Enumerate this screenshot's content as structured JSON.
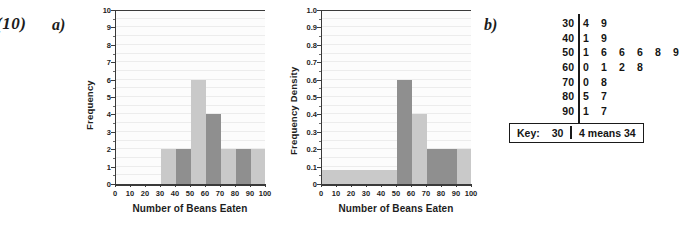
{
  "question": {
    "number": "(10)",
    "part_a": "a)",
    "part_b": "b)"
  },
  "chart_data": [
    {
      "id": "frequency-histogram",
      "type": "bar",
      "title": "",
      "xlabel": "Number of Beans Eaten",
      "ylabel": "Frequency",
      "xlim": [
        0,
        100
      ],
      "ylim": [
        0,
        10
      ],
      "xticks": [
        0,
        10,
        20,
        30,
        40,
        50,
        60,
        70,
        80,
        90,
        100
      ],
      "yticks": [
        0,
        1,
        2,
        3,
        4,
        5,
        6,
        7,
        8,
        9,
        10
      ],
      "grid": true,
      "bars": [
        {
          "x0": 30,
          "x1": 40,
          "value": 2,
          "color": "#c9c9c9"
        },
        {
          "x0": 40,
          "x1": 50,
          "value": 2,
          "color": "#8f8f8f"
        },
        {
          "x0": 50,
          "x1": 60,
          "value": 6,
          "color": "#c9c9c9"
        },
        {
          "x0": 60,
          "x1": 70,
          "value": 4,
          "color": "#8f8f8f"
        },
        {
          "x0": 70,
          "x1": 80,
          "value": 2,
          "color": "#c9c9c9"
        },
        {
          "x0": 80,
          "x1": 90,
          "value": 2,
          "color": "#8f8f8f"
        },
        {
          "x0": 90,
          "x1": 100,
          "value": 2,
          "color": "#c9c9c9"
        }
      ]
    },
    {
      "id": "frequency-density-histogram",
      "type": "bar",
      "title": "",
      "xlabel": "Number of Beans Eaten",
      "ylabel": "Frequency  Density",
      "xlim": [
        0,
        100
      ],
      "ylim": [
        0,
        1.0
      ],
      "xticks": [
        0,
        10,
        20,
        30,
        40,
        50,
        60,
        70,
        80,
        90,
        100
      ],
      "yticks": [
        "0",
        "0.1",
        "0.2",
        "0.3",
        "0.4",
        "0.5",
        "0.6",
        "0.7",
        "0.8",
        "0.9",
        "1.0"
      ],
      "grid": true,
      "bars": [
        {
          "x0": 0,
          "x1": 50,
          "value": 0.08,
          "color": "#c9c9c9"
        },
        {
          "x0": 50,
          "x1": 60,
          "value": 0.6,
          "color": "#8f8f8f"
        },
        {
          "x0": 60,
          "x1": 70,
          "value": 0.4,
          "color": "#c9c9c9"
        },
        {
          "x0": 70,
          "x1": 90,
          "value": 0.2,
          "color": "#8f8f8f"
        },
        {
          "x0": 90,
          "x1": 100,
          "value": 0.2,
          "color": "#c9c9c9"
        }
      ]
    }
  ],
  "stem_and_leaf": {
    "rows": [
      {
        "stem": "30",
        "leaves": [
          "4",
          "9"
        ]
      },
      {
        "stem": "40",
        "leaves": [
          "1",
          "9"
        ]
      },
      {
        "stem": "50",
        "leaves": [
          "1",
          "6",
          "6",
          "6",
          "8",
          "9"
        ]
      },
      {
        "stem": "60",
        "leaves": [
          "0",
          "1",
          "2",
          "8"
        ]
      },
      {
        "stem": "70",
        "leaves": [
          "0",
          "8"
        ]
      },
      {
        "stem": "80",
        "leaves": [
          "5",
          "7"
        ]
      },
      {
        "stem": "90",
        "leaves": [
          "1",
          "7"
        ]
      }
    ],
    "key": {
      "label": "Key:",
      "stem": "30",
      "means": "4 means 34"
    }
  },
  "colors": {
    "bar_light": "#c9c9c9",
    "bar_dark": "#8f8f8f",
    "axis": "#3a3a3a",
    "grid": "#ececec",
    "text": "#1d1d1d"
  }
}
